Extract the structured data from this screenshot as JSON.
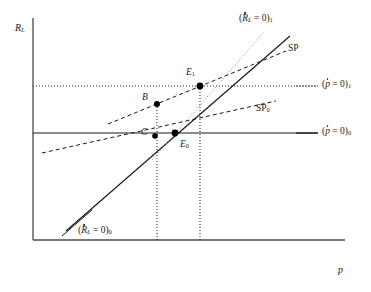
{
  "figure": {
    "type": "economics-phase-diagram",
    "axes": {
      "y_label": "R",
      "y_label_sub": "L",
      "x_label": "p"
    },
    "curves": [
      {
        "id": "Rdot0_new",
        "label_main": "R",
        "label_sub": "L",
        "label_eq": " = 0)",
        "label_index": "1",
        "label_open": "(",
        "style": "dotted",
        "slope": "steep-positive"
      },
      {
        "id": "Rdot0_old",
        "label_main": "R",
        "label_sub": "L",
        "label_eq": " = 0)",
        "label_index": "0",
        "label_open": "(",
        "style": "solid",
        "slope": "steep-positive"
      },
      {
        "id": "pdot0_new",
        "label_main": "p",
        "label_eq": " = 0)",
        "label_index": "1",
        "label_open": "(",
        "style": "dotted",
        "slope": "horizontal"
      },
      {
        "id": "pdot0_old",
        "label_main": "p",
        "label_eq": " = 0)",
        "label_index": "0",
        "label_open": "(",
        "style": "solid",
        "slope": "horizontal"
      },
      {
        "id": "SP_new",
        "label": "SP",
        "style": "dashed",
        "slope": "shallow-positive"
      },
      {
        "id": "SP_old",
        "label": "SP",
        "label_index": "0",
        "style": "dashed",
        "slope": "shallow-positive"
      }
    ],
    "points": [
      {
        "name": "E1",
        "label": "E",
        "sub": "1",
        "x": 200,
        "y": 86
      },
      {
        "name": "B",
        "label": "B",
        "sub": "",
        "x": 157,
        "y": 104
      },
      {
        "name": "E0",
        "label": "E",
        "sub": "0",
        "x": 175,
        "y": 133
      },
      {
        "name": "C",
        "label": "C",
        "sub": "",
        "x": 155,
        "y": 136
      }
    ],
    "labels": {
      "Rdot_new_open": "(",
      "Rdot_new_R": "R",
      "Rdot_new_sub": "L",
      "Rdot_new_eq": " = 0)",
      "Rdot_new_idx": "1",
      "Rdot_old_open": "(",
      "Rdot_old_R": "R",
      "Rdot_old_sub": "L",
      "Rdot_old_eq": " = 0)",
      "Rdot_old_idx": "0",
      "pdot_new_open": "(",
      "pdot_new_p": "p",
      "pdot_new_eq": " = 0)",
      "pdot_new_idx": "1",
      "pdot_old_open": "(",
      "pdot_old_p": "p",
      "pdot_old_eq": " = 0)",
      "pdot_old_idx": "0",
      "sp_new": "SP",
      "sp_old": "SP",
      "sp_old_idx": "0",
      "point_E1": "E",
      "point_E1_sub": "1",
      "point_B": "B",
      "point_E0": "E",
      "point_E0_sub": "0",
      "point_C": "C",
      "y_axis": "R",
      "y_axis_sub": "L",
      "x_axis": "p"
    },
    "colors": {
      "line": "#1a1a1a",
      "frame": "#4a4a4a",
      "point": "#000000",
      "background": "#ffffff"
    }
  }
}
